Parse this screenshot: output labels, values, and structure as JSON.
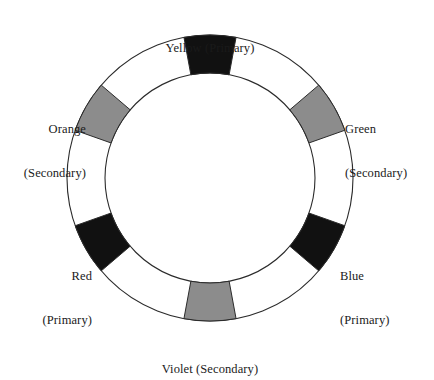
{
  "diagram": {
    "type": "color-wheel-ring",
    "background_color": "#ffffff",
    "ring": {
      "center_x": 210,
      "center_y": 178,
      "outer_radius": 143,
      "inner_radius": 105,
      "band_fill": "#ffffff",
      "stroke_color": "#2b2b2b",
      "stroke_width": 1
    },
    "swatch_colors": {
      "primary_fill": "#111111",
      "secondary_fill": "#8c8c8c",
      "swatch_stroke": "#2b2b2b"
    },
    "segments": [
      {
        "id": "yellow",
        "name": "Yellow",
        "category": "Primary",
        "label": "Yellow (Primary)",
        "label_lines": [
          "Yellow (Primary)"
        ],
        "angle_deg": 0,
        "swatch_fill": "#111111",
        "label_align": "center"
      },
      {
        "id": "green",
        "name": "Green",
        "category": "Secondary",
        "label": "Green (Secondary)",
        "label_lines": [
          "Green",
          "(Secondary)"
        ],
        "angle_deg": 60,
        "swatch_fill": "#8c8c8c",
        "label_align": "left"
      },
      {
        "id": "blue",
        "name": "Blue",
        "category": "Primary",
        "label": "Blue (Primary)",
        "label_lines": [
          "Blue",
          "(Primary)"
        ],
        "angle_deg": 120,
        "swatch_fill": "#111111",
        "label_align": "left"
      },
      {
        "id": "violet",
        "name": "Violet",
        "category": "Secondary",
        "label": "Violet (Secondary)",
        "label_lines": [
          "Violet (Secondary)"
        ],
        "angle_deg": 180,
        "swatch_fill": "#8c8c8c",
        "label_align": "center"
      },
      {
        "id": "red",
        "name": "Red",
        "category": "Primary",
        "label": "Red (Primary)",
        "label_lines": [
          "Red",
          "(Primary)"
        ],
        "angle_deg": 240,
        "swatch_fill": "#111111",
        "label_align": "right"
      },
      {
        "id": "orange",
        "name": "Orange",
        "category": "Secondary",
        "label": "Orange (Secondary)",
        "label_lines": [
          "Orange",
          "(Secondary)"
        ],
        "angle_deg": 300,
        "swatch_fill": "#8c8c8c",
        "label_align": "right"
      }
    ]
  }
}
